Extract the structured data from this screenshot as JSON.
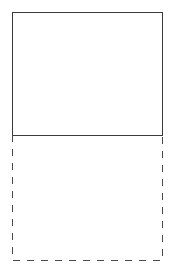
{
  "diagram": {
    "solid_box": {
      "label": "",
      "stroke": "#3a3a3a",
      "style": "solid"
    },
    "dashed_box": {
      "label": "",
      "stroke": "#4a4a4a",
      "style": "dashed"
    }
  }
}
